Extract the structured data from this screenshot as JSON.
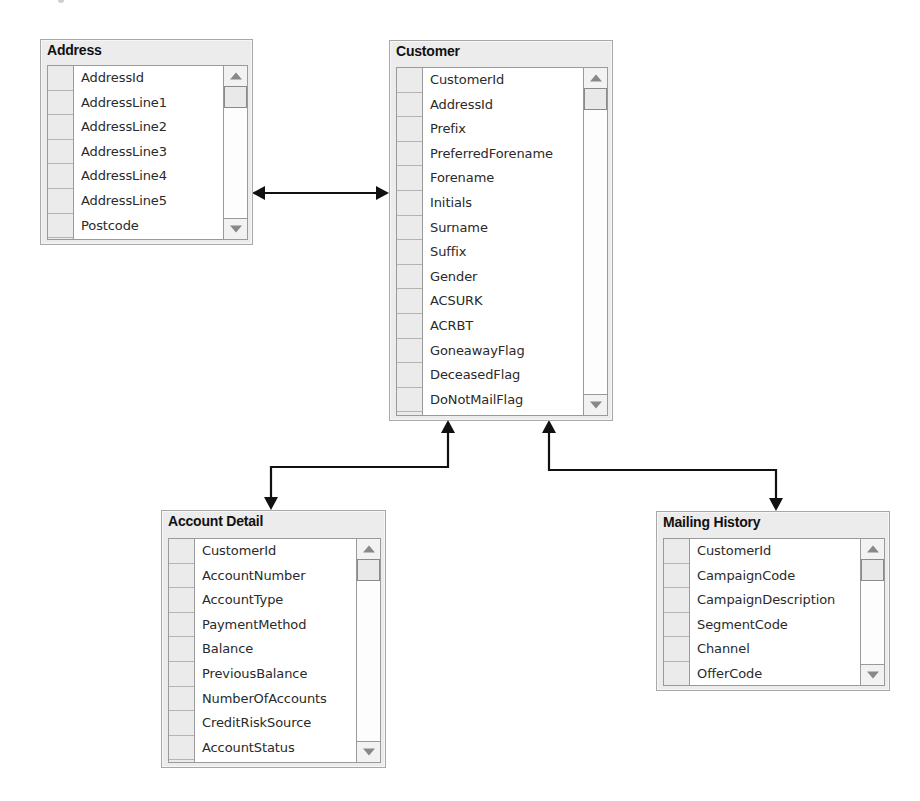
{
  "diagram": {
    "type": "entity-relationship",
    "tables": [
      {
        "id": "address",
        "title": "Address",
        "fields": [
          "AddressId",
          "AddressLine1",
          "AddressLine2",
          "AddressLine3",
          "AddressLine4",
          "AddressLine5",
          "Postcode"
        ]
      },
      {
        "id": "customer",
        "title": "Customer",
        "fields": [
          "CustomerId",
          "AddressId",
          "Prefix",
          "PreferredForename",
          "Forename",
          "Initials",
          "Surname",
          "Suffix",
          "Gender",
          "ACSURK",
          "ACRBT",
          "GoneawayFlag",
          "DeceasedFlag",
          "DoNotMailFlag"
        ]
      },
      {
        "id": "account_detail",
        "title": "Account Detail",
        "fields": [
          "CustomerId",
          "AccountNumber",
          "AccountType",
          "PaymentMethod",
          "Balance",
          "PreviousBalance",
          "NumberOfAccounts",
          "CreditRiskSource",
          "AccountStatus"
        ]
      },
      {
        "id": "mailing_history",
        "title": "Mailing History",
        "fields": [
          "CustomerId",
          "CampaignCode",
          "CampaignDescription",
          "SegmentCode",
          "Channel",
          "OfferCode"
        ]
      }
    ],
    "relationships": [
      {
        "from": "Address",
        "to": "Customer",
        "style": "bidirectional-arrow"
      },
      {
        "from": "Customer",
        "to": "Account Detail",
        "style": "bidirectional-arrow"
      },
      {
        "from": "Customer",
        "to": "Mailing History",
        "style": "bidirectional-arrow"
      }
    ],
    "colors": {
      "background": "#ffffff",
      "table_frame": "#ececec",
      "table_border": "#a8a8a8",
      "list_background": "#ffffff",
      "row_selector": "#ebebeb",
      "connector": "#111111",
      "text": "#2a2a2a"
    }
  }
}
